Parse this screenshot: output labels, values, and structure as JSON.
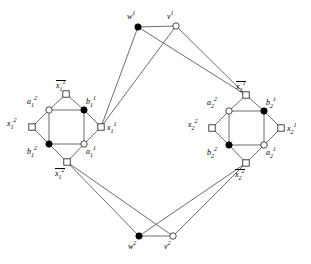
{
  "figure": {
    "type": "graph-diagram",
    "background_color": "#ffffff",
    "edge_color": "#3c3c3c",
    "node_fill_filled": "#000000",
    "node_fill_open": "#ffffff"
  },
  "nodes": [
    {
      "id": "w1",
      "label_base": "w",
      "sup": "1",
      "sub": "",
      "overline": false,
      "shape": "circle",
      "fill": "filled",
      "x": 138,
      "y": 27,
      "label_x": 127,
      "label_y": 13
    },
    {
      "id": "v1",
      "label_base": "v",
      "sup": "1",
      "sub": "",
      "overline": false,
      "shape": "circle",
      "fill": "open",
      "x": 176,
      "y": 26,
      "label_x": 167,
      "label_y": 13
    },
    {
      "id": "w2",
      "label_base": "w",
      "sup": "2",
      "sub": "",
      "overline": false,
      "shape": "circle",
      "fill": "filled",
      "x": 139,
      "y": 236,
      "label_x": 128,
      "label_y": 243
    },
    {
      "id": "v2",
      "label_base": "v",
      "sup": "2",
      "sub": "",
      "overline": false,
      "shape": "circle",
      "fill": "open",
      "x": 173,
      "y": 236,
      "label_x": 164,
      "label_y": 243
    },
    {
      "id": "nx1_1",
      "label_base": "x",
      "sup": "1",
      "sub": "1",
      "overline": true,
      "shape": "square",
      "fill": "open",
      "x": 66,
      "y": 94,
      "label_x": 56,
      "label_y": 80
    },
    {
      "id": "x1_2",
      "label_base": "x",
      "sup": "2",
      "sub": "1",
      "overline": false,
      "shape": "square",
      "fill": "open",
      "x": 32,
      "y": 127,
      "label_x": 7,
      "label_y": 120
    },
    {
      "id": "x1_1",
      "label_base": "x",
      "sup": "1",
      "sub": "1",
      "overline": false,
      "shape": "square",
      "fill": "open",
      "x": 101,
      "y": 127,
      "label_x": 107,
      "label_y": 124
    },
    {
      "id": "nx1_2",
      "label_base": "x",
      "sup": "2",
      "sub": "1",
      "overline": true,
      "shape": "square",
      "fill": "open",
      "x": 67,
      "y": 162,
      "label_x": 55,
      "label_y": 168
    },
    {
      "id": "a1_2",
      "label_base": "a",
      "sup": "2",
      "sub": "1",
      "overline": false,
      "shape": "circle",
      "fill": "open",
      "x": 49,
      "y": 110,
      "label_x": 27,
      "label_y": 98
    },
    {
      "id": "b1_1",
      "label_base": "b",
      "sup": "1",
      "sub": "1",
      "overline": false,
      "shape": "circle",
      "fill": "filled",
      "x": 84,
      "y": 110,
      "label_x": 86,
      "label_y": 98
    },
    {
      "id": "b1_2",
      "label_base": "b",
      "sup": "2",
      "sub": "1",
      "overline": false,
      "shape": "circle",
      "fill": "filled",
      "x": 49,
      "y": 144,
      "label_x": 27,
      "label_y": 148
    },
    {
      "id": "a1_1",
      "label_base": "a",
      "sup": "1",
      "sub": "1",
      "overline": false,
      "shape": "circle",
      "fill": "open",
      "x": 84,
      "y": 144,
      "label_x": 86,
      "label_y": 148
    },
    {
      "id": "nx2_1",
      "label_base": "x",
      "sup": "1",
      "sub": "2",
      "overline": true,
      "shape": "square",
      "fill": "open",
      "x": 246,
      "y": 95,
      "label_x": 236,
      "label_y": 81
    },
    {
      "id": "x2_2",
      "label_base": "x",
      "sup": "2",
      "sub": "2",
      "overline": false,
      "shape": "square",
      "fill": "open",
      "x": 212,
      "y": 128,
      "label_x": 188,
      "label_y": 121
    },
    {
      "id": "x2_1",
      "label_base": "x",
      "sup": "1",
      "sub": "2",
      "overline": false,
      "shape": "square",
      "fill": "open",
      "x": 281,
      "y": 128,
      "label_x": 287,
      "label_y": 125
    },
    {
      "id": "nx2_2",
      "label_base": "x",
      "sup": "2",
      "sub": "2",
      "overline": true,
      "shape": "square",
      "fill": "open",
      "x": 246,
      "y": 163,
      "label_x": 235,
      "label_y": 169
    },
    {
      "id": "a2_2",
      "label_base": "a",
      "sup": "2",
      "sub": "2",
      "overline": false,
      "shape": "circle",
      "fill": "open",
      "x": 229,
      "y": 111,
      "label_x": 207,
      "label_y": 99
    },
    {
      "id": "b2_1",
      "label_base": "b",
      "sup": "1",
      "sub": "2",
      "overline": false,
      "shape": "circle",
      "fill": "filled",
      "x": 264,
      "y": 111,
      "label_x": 266,
      "label_y": 99
    },
    {
      "id": "b2_2",
      "label_base": "b",
      "sup": "2",
      "sub": "2",
      "overline": false,
      "shape": "circle",
      "fill": "filled",
      "x": 229,
      "y": 145,
      "label_x": 207,
      "label_y": 149
    },
    {
      "id": "a2_1",
      "label_base": "a",
      "sup": "1",
      "sub": "2",
      "overline": false,
      "shape": "circle",
      "fill": "open",
      "x": 264,
      "y": 145,
      "label_x": 266,
      "label_y": 149
    }
  ],
  "edges": [
    {
      "from": "w1",
      "to": "v1"
    },
    {
      "from": "w1",
      "to": "x1_1"
    },
    {
      "from": "w1",
      "to": "nx2_1"
    },
    {
      "from": "v1",
      "to": "x1_1"
    },
    {
      "from": "v1",
      "to": "nx2_1"
    },
    {
      "from": "w2",
      "to": "v2"
    },
    {
      "from": "w2",
      "to": "nx1_2"
    },
    {
      "from": "w2",
      "to": "nx2_2"
    },
    {
      "from": "v2",
      "to": "nx1_2"
    },
    {
      "from": "v2",
      "to": "nx2_2"
    },
    {
      "from": "nx1_1",
      "to": "a1_2"
    },
    {
      "from": "nx1_1",
      "to": "b1_1"
    },
    {
      "from": "x1_2",
      "to": "a1_2"
    },
    {
      "from": "x1_2",
      "to": "b1_2"
    },
    {
      "from": "x1_1",
      "to": "b1_1"
    },
    {
      "from": "x1_1",
      "to": "a1_1"
    },
    {
      "from": "nx1_2",
      "to": "b1_2"
    },
    {
      "from": "nx1_2",
      "to": "a1_1"
    },
    {
      "from": "a1_2",
      "to": "b1_1"
    },
    {
      "from": "b1_1",
      "to": "a1_1"
    },
    {
      "from": "a1_1",
      "to": "b1_2"
    },
    {
      "from": "b1_2",
      "to": "a1_2"
    },
    {
      "from": "nx2_1",
      "to": "a2_2"
    },
    {
      "from": "nx2_1",
      "to": "b2_1"
    },
    {
      "from": "x2_2",
      "to": "a2_2"
    },
    {
      "from": "x2_2",
      "to": "b2_2"
    },
    {
      "from": "x2_1",
      "to": "b2_1"
    },
    {
      "from": "x2_1",
      "to": "a2_1"
    },
    {
      "from": "nx2_2",
      "to": "b2_2"
    },
    {
      "from": "nx2_2",
      "to": "a2_1"
    },
    {
      "from": "a2_2",
      "to": "b2_1"
    },
    {
      "from": "b2_1",
      "to": "a2_1"
    },
    {
      "from": "a2_1",
      "to": "b2_2"
    },
    {
      "from": "b2_2",
      "to": "a2_2"
    }
  ]
}
